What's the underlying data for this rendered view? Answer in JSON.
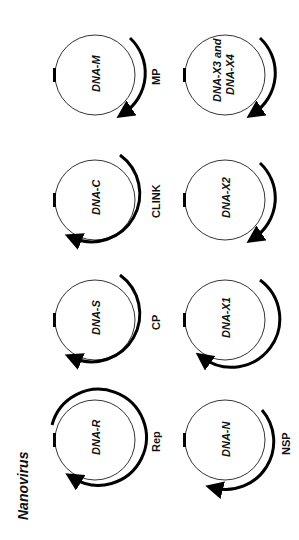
{
  "figure": {
    "title": "Nanovirus",
    "orientation": "rotated 90° counter-clockwise",
    "components": [
      {
        "name": "DNA-M",
        "protein": "MP"
      },
      {
        "name": "DNA-C",
        "protein": "CLINK"
      },
      {
        "name": "DNA-S",
        "protein": "CP"
      },
      {
        "name": "DNA-R",
        "protein": "Rep"
      },
      {
        "name_line1": "DNA-X3 and",
        "name_line2": "DNA-X4",
        "protein": ""
      },
      {
        "name": "DNA-X2",
        "protein": ""
      },
      {
        "name": "DNA-X1",
        "protein": ""
      },
      {
        "name": "DNA-N",
        "protein": "NSP"
      }
    ]
  }
}
